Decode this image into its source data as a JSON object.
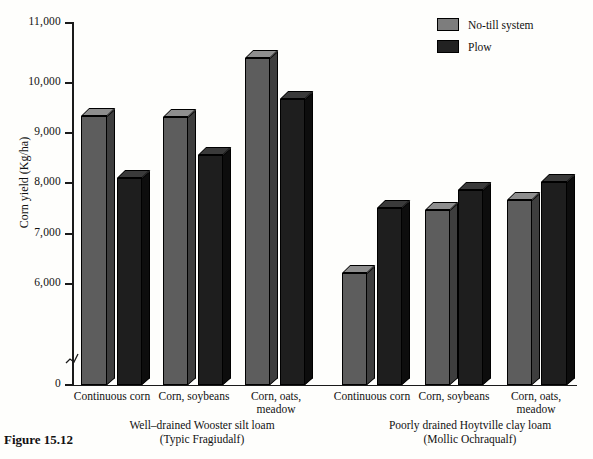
{
  "figure": {
    "caption": "Figure 15.12"
  },
  "legend": {
    "position": "top-right",
    "items": [
      {
        "label": "No-till system",
        "color": "#7d7d7d",
        "swatch_name": "notill-swatch"
      },
      {
        "label": "Plow",
        "color": "#222222",
        "swatch_name": "plow-swatch"
      }
    ]
  },
  "axes": {
    "ylabel": "Corn yield (Kg/ha)",
    "yticks": [
      "0",
      "6,000",
      "7,000",
      "8,000",
      "9,000",
      "10,000",
      "11,000"
    ],
    "ytick_values": [
      0,
      6000,
      7000,
      8000,
      9000,
      10000,
      11000
    ],
    "axis_break": true,
    "grid": false
  },
  "panels": [
    {
      "title": "Well–drained Wooster silt loam\n(Typic Fragiudalf)",
      "categories": [
        "Continuous corn",
        "Corn, soybeans",
        "Corn, oats,\nmeadow"
      ]
    },
    {
      "title": "Poorly drained Hoytville clay loam\n(Mollic Ochraqualf)",
      "categories": [
        "Continuous corn",
        "Corn, soybeans",
        "Corn, oats,\nmeadow"
      ]
    }
  ],
  "chart_data": {
    "type": "bar",
    "title": "",
    "xlabel": "",
    "ylabel": "Corn yield (Kg/ha)",
    "ylim": [
      0,
      11000
    ],
    "y_axis_break": [
      0,
      6000
    ],
    "grid": false,
    "legend_position": "top-right",
    "categories": [
      "Continuous corn (Wooster)",
      "Corn, soybeans (Wooster)",
      "Corn, oats, meadow (Wooster)",
      "Continuous corn (Hoytville)",
      "Corn, soybeans (Hoytville)",
      "Corn, oats, meadow (Hoytville)"
    ],
    "series": [
      {
        "name": "No-till system",
        "color": "#5d5d5d",
        "values": [
          9400,
          9380,
          10450,
          6800,
          7870,
          8050
        ]
      },
      {
        "name": "Plow",
        "color": "#1e1e1e",
        "values": [
          8400,
          8750,
          9700,
          7920,
          8220,
          8350
        ]
      }
    ]
  },
  "bars": [
    {
      "name": "bar-wooster-continuous-notill",
      "series": "No-till system",
      "value": 9400,
      "left": 81,
      "width": 26,
      "top": 116
    },
    {
      "name": "bar-wooster-continuous-plow",
      "series": "Plow",
      "value": 8400,
      "left": 117,
      "width": 25,
      "top": 178
    },
    {
      "name": "bar-wooster-soybeans-notill",
      "series": "No-till system",
      "value": 9380,
      "left": 163,
      "width": 25,
      "top": 117
    },
    {
      "name": "bar-wooster-soybeans-plow",
      "series": "Plow",
      "value": 8750,
      "left": 198,
      "width": 25,
      "top": 155
    },
    {
      "name": "bar-wooster-meadow-notill",
      "series": "No-till system",
      "value": 10450,
      "left": 245,
      "width": 25,
      "top": 58
    },
    {
      "name": "bar-wooster-meadow-plow",
      "series": "Plow",
      "value": 9700,
      "left": 280,
      "width": 25,
      "top": 99
    },
    {
      "name": "bar-hoytville-continuous-notill",
      "series": "No-till system",
      "value": 6800,
      "left": 342,
      "width": 25,
      "top": 273
    },
    {
      "name": "bar-hoytville-continuous-plow",
      "series": "Plow",
      "value": 7920,
      "left": 377,
      "width": 25,
      "top": 208
    },
    {
      "name": "bar-hoytville-soybeans-notill",
      "series": "No-till system",
      "value": 7870,
      "left": 425,
      "width": 25,
      "top": 210
    },
    {
      "name": "bar-hoytville-soybeans-plow",
      "series": "Plow",
      "value": 8220,
      "left": 458,
      "width": 25,
      "top": 190
    },
    {
      "name": "bar-hoytville-meadow-notill",
      "series": "No-till system",
      "value": 8050,
      "left": 507,
      "width": 25,
      "top": 200
    },
    {
      "name": "bar-hoytville-meadow-plow",
      "series": "Plow",
      "value": 8350,
      "left": 541,
      "width": 26,
      "top": 182
    }
  ],
  "tick_layout": [
    {
      "label": "11,000",
      "y": 23
    },
    {
      "label": "10,000",
      "y": 83
    },
    {
      "label": "9,000",
      "y": 133
    },
    {
      "label": "8,000",
      "y": 183
    },
    {
      "label": "7,000",
      "y": 234
    },
    {
      "label": "6,000",
      "y": 284
    },
    {
      "label": "0",
      "y": 385
    }
  ],
  "category_layout": [
    {
      "label": "Continuous corn",
      "left": 68,
      "width": 88,
      "top": 390
    },
    {
      "label": "Corn, soybeans",
      "left": 150,
      "width": 88,
      "top": 390
    },
    {
      "label": "Corn, oats,\nmeadow",
      "left": 232,
      "width": 88,
      "top": 390
    },
    {
      "label": "Continuous corn",
      "left": 328,
      "width": 88,
      "top": 390
    },
    {
      "label": "Corn, soybeans",
      "left": 410,
      "width": 88,
      "top": 390
    },
    {
      "label": "Corn, oats,\nmeadow",
      "left": 492,
      "width": 88,
      "top": 390
    }
  ],
  "panel_layout": [
    {
      "left": 92,
      "width": 220,
      "top": 418
    },
    {
      "left": 350,
      "width": 240,
      "top": 418
    }
  ]
}
